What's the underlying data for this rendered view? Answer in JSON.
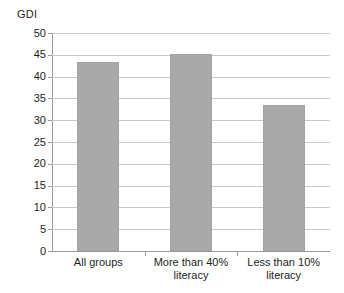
{
  "chart_data": {
    "type": "bar",
    "title": "",
    "xlabel": "",
    "ylabel": "GDI",
    "categories": [
      "All groups",
      "More than 40% literacy",
      "Less than 10% literacy"
    ],
    "values": [
      43.3,
      45.2,
      33.5
    ],
    "ylim": [
      0,
      50
    ],
    "ytick_step": 5,
    "yticks": [
      50,
      45,
      40,
      35,
      30,
      25,
      20,
      15,
      10,
      5,
      0
    ],
    "ytick_labels": [
      "50",
      "45",
      "40",
      "35",
      "30",
      "25",
      "20",
      "15",
      "10",
      "5",
      "0"
    ],
    "grid": true,
    "grid_axis": "y",
    "legend": false,
    "legend_position": "none",
    "bar_color": "#a9a9a9",
    "gridline_color": "#c8c8c8",
    "axis_color": "#9a9a9a",
    "background_color": "#ffffff",
    "text_color": "#1d1d1d"
  }
}
